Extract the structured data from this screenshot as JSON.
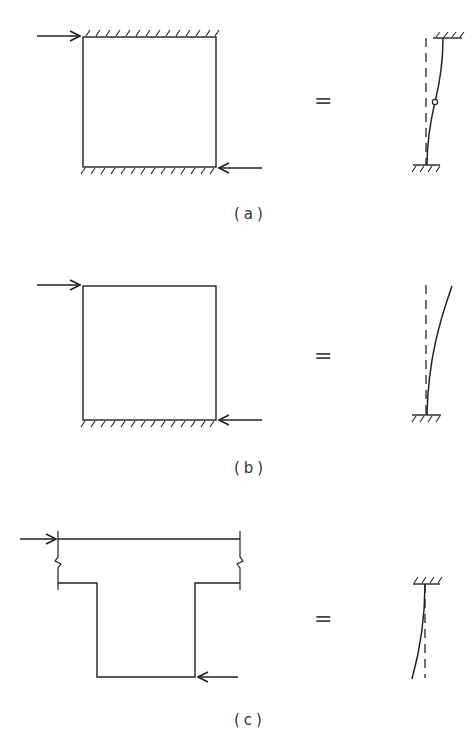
{
  "figure": {
    "panels": [
      {
        "id": "a",
        "label": "(a)",
        "description": "Wall panel fixed at top and bottom, lateral load at top-left and reaction at bottom-right",
        "equals": "=",
        "support_top": true,
        "support_bottom": true,
        "equivalent": "column fixed at both ends with inflection point at mid-height"
      },
      {
        "id": "b",
        "label": "(b)",
        "description": "Wall panel fixed at bottom only (cantilever), lateral load at top-left and reaction at bottom-right",
        "equals": "=",
        "support_top": false,
        "support_bottom": true,
        "equivalent": "cantilever column fixed at base"
      },
      {
        "id": "c",
        "label": "(c)",
        "description": "T-shaped section with broken flange, load at top-left and reaction at bottom-right of web",
        "equals": "=",
        "support_top": true,
        "support_bottom": false,
        "equivalent": "cantilever column fixed at top"
      }
    ],
    "colors": {
      "line": "#222222",
      "background": "#ffffff"
    }
  }
}
